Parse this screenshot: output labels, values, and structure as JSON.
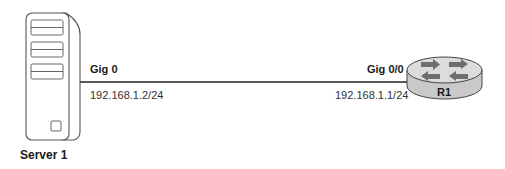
{
  "diagram": {
    "type": "network-topology",
    "devices": [
      {
        "id": "server1",
        "label": "Server 1",
        "kind": "server"
      },
      {
        "id": "r1",
        "label": "R1",
        "kind": "router"
      }
    ],
    "links": [
      {
        "from": "server1",
        "to": "r1",
        "from_interface": "Gig 0",
        "from_ip": "192.168.1.2/24",
        "to_interface": "Gig 0/0",
        "to_ip": "192.168.1.1/24"
      }
    ]
  },
  "labels": {
    "server_name": "Server 1",
    "router_name": "R1",
    "server_interface": "Gig 0",
    "server_ip": "192.168.1.2/24",
    "router_interface": "Gig 0/0",
    "router_ip": "192.168.1.1/24"
  },
  "colors": {
    "line": "#222222",
    "router_top": "#d9d9d9",
    "router_side": "#c4c4c4",
    "router_arrows": "#6e6e6e",
    "server_outline": "#555555"
  }
}
